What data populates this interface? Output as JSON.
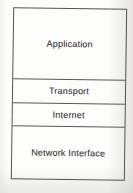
{
  "diagram": {
    "layers": [
      {
        "label": "Application"
      },
      {
        "label": "Transport"
      },
      {
        "label": "Internet"
      },
      {
        "label": "Network Interface"
      }
    ],
    "colors": {
      "line": "#535353",
      "text": "#3f3f3f",
      "paper": "#fdfdfc"
    }
  }
}
